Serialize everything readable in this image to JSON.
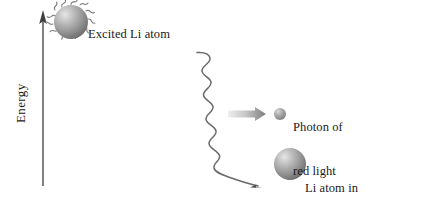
{
  "diagram": {
    "axis": {
      "label": "Energy",
      "direction": "upward-arrow",
      "icon": "axis-arrow-icon"
    },
    "labels": {
      "excited_atom": "Excited Li atom",
      "photon_line1": "Photon of",
      "photon_line2": "red light",
      "photon_line3": "emitted",
      "lower_atom_line1": "Li atom in",
      "lower_atom_line2": "lower energy state"
    },
    "elements": {
      "excited_atom_icon": "excited-atom-sphere-icon",
      "photon_icon": "photon-sphere-icon",
      "lower_atom_icon": "lower-atom-sphere-icon",
      "emission_wave_icon": "wavy-emission-arrow-icon",
      "photon_arrow_icon": "gradient-arrow-icon",
      "upper_level_icon": "upper-energy-level-line",
      "lower_level_icon": "lower-energy-level-line"
    },
    "colors": {
      "background": "#ffffff",
      "line": "#5a5a5a",
      "text": "#1a1a1a",
      "sphere_light": "#d8d8d8",
      "sphere_mid": "#a0a0a0",
      "sphere_dark": "#6b6b6b",
      "arrow_light": "#e2e2e2",
      "arrow_dark": "#7d7d7d"
    }
  }
}
